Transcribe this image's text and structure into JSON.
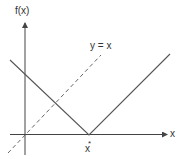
{
  "diagram": {
    "y_axis_label": "f(x)",
    "x_axis_label": "x",
    "reference_line_label": "y = x",
    "minimizer_label": "x",
    "minimizer_superscript": "*",
    "colors": {
      "axis": "#444444",
      "curve": "#555555",
      "reference_line": "#666666",
      "text": "#333333"
    }
  }
}
